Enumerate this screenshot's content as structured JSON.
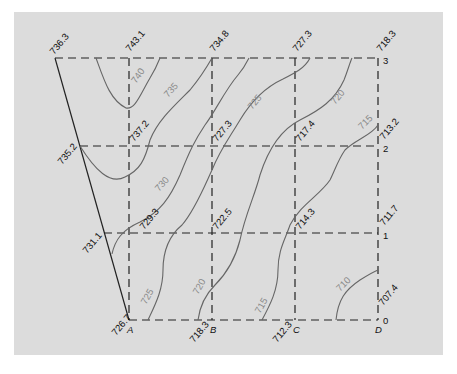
{
  "diagram": {
    "type": "topographic contour map from grid spot elevations",
    "columns": [
      "A",
      "B",
      "C",
      "D"
    ],
    "rows": [
      "0",
      "1",
      "2",
      "3"
    ],
    "spot_elevations": {
      "corner_top_left": "736.3",
      "A3": "743.1",
      "B3": "734.8",
      "C3": "727.3",
      "D3": "718.3",
      "left_row2": "735.2",
      "A2": "737.2",
      "B2": "727.3",
      "C2": "717.4",
      "D2": "713.2",
      "left_row1": "731.1",
      "A1": "729.3",
      "B1": "722.5",
      "C1": "714.3",
      "D1": "711.7",
      "A0": "726.7",
      "B0": "718.3",
      "C0": "712.3",
      "D0": "707.4"
    },
    "contour_labels": [
      "740",
      "735",
      "730",
      "725",
      "725",
      "720",
      "720",
      "715",
      "715",
      "710"
    ],
    "colors": {
      "background": "#dcdcdc",
      "grid": "#222222",
      "contour": "#666666",
      "contour_label": "#888888"
    }
  }
}
